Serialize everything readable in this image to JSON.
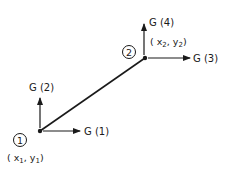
{
  "diagram": {
    "type": "beam-element-dof",
    "line_color": "#1a1a1a",
    "nodes": [
      {
        "id": "1",
        "coord_label": "x1",
        "coord_label_y": "y1"
      },
      {
        "id": "2",
        "coord_label": "x2",
        "coord_label_y": "y2"
      }
    ],
    "dof_labels": {
      "g1": "G (1)",
      "g2": "G (2)",
      "g3": "G (3)",
      "g4": "G (4)"
    },
    "node1_circle_label": "1",
    "node2_circle_label": "2",
    "node1_coords": {
      "open": "( x",
      "sub1": "1",
      "comma": ", y",
      "sub2": "1",
      "close": ")"
    },
    "node2_coords": {
      "open": "( x",
      "sub1": "2",
      "comma": ", y",
      "sub2": "2",
      "close": ")"
    }
  }
}
